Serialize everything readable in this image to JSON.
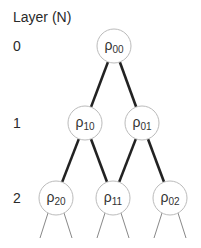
{
  "title": "Layer (N)",
  "layers": [
    {
      "label": "0",
      "y": 46
    },
    {
      "label": "1",
      "y": 123
    },
    {
      "label": "2",
      "y": 198
    }
  ],
  "nodes": [
    {
      "id": "p00",
      "symbol": "ρ",
      "sub": "00",
      "x": 114,
      "y": 46
    },
    {
      "id": "p10",
      "symbol": "ρ",
      "sub": "10",
      "x": 85,
      "y": 123
    },
    {
      "id": "p01",
      "symbol": "ρ",
      "sub": "01",
      "x": 142,
      "y": 123
    },
    {
      "id": "p20",
      "symbol": "ρ",
      "sub": "20",
      "x": 56,
      "y": 198
    },
    {
      "id": "p11",
      "symbol": "ρ",
      "sub": "11",
      "x": 113,
      "y": 198
    },
    {
      "id": "p02",
      "symbol": "ρ",
      "sub": "02",
      "x": 170,
      "y": 198
    }
  ],
  "edges": [
    [
      "p00",
      "p10"
    ],
    [
      "p00",
      "p01"
    ],
    [
      "p10",
      "p20"
    ],
    [
      "p10",
      "p11"
    ],
    [
      "p01",
      "p11"
    ],
    [
      "p01",
      "p02"
    ]
  ],
  "style": {
    "node_radius": 17,
    "node_stroke": "#bbbbbb",
    "edge_color": "#222222",
    "edge_width": 2.6,
    "fan_color": "#888888"
  }
}
